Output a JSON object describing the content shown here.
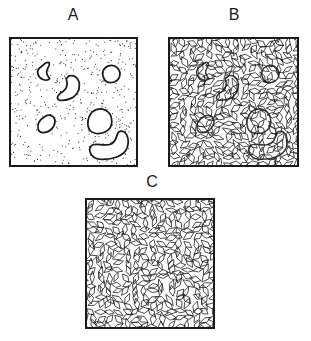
{
  "figure": {
    "panels": [
      {
        "id": "A",
        "label": "A",
        "pattern": "stippled-dots",
        "features": "isolated blob outlines (6)"
      },
      {
        "id": "B",
        "label": "B",
        "pattern": "rhombus-mosaic",
        "features": "mosaic with faint blob outlines (6)"
      },
      {
        "id": "C",
        "label": "C",
        "pattern": "rhombus-mosaic",
        "features": "uniform mosaic, no outlines"
      }
    ],
    "colors": {
      "ink": "#1a1a1a",
      "background": "#ffffff"
    }
  }
}
